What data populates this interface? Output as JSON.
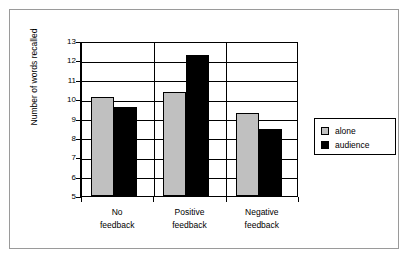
{
  "chart_data": {
    "type": "bar",
    "title": "",
    "xlabel": "",
    "ylabel": "Number of words recalled",
    "ylim": [
      5,
      13
    ],
    "yticks": [
      5,
      6,
      7,
      8,
      9,
      10,
      11,
      12,
      13
    ],
    "grid": true,
    "legend_position": "right",
    "categories": [
      "No feedback",
      "Positive feedback",
      "Negative feedback"
    ],
    "category_lines": [
      [
        "No",
        "feedback"
      ],
      [
        "Positive",
        "feedback"
      ],
      [
        "Negative",
        "feedback"
      ]
    ],
    "series": [
      {
        "name": "alone",
        "color": "#c0c0c0",
        "values": [
          10.1,
          10.35,
          9.3
        ]
      },
      {
        "name": "audience",
        "color": "#000000",
        "values": [
          9.6,
          12.3,
          8.45
        ]
      }
    ]
  },
  "legend": {
    "items": [
      {
        "label": "alone"
      },
      {
        "label": "audience"
      }
    ]
  },
  "axis": {
    "y_title": "Number of words recalled",
    "y_tick_labels": [
      "13",
      "12",
      "11",
      "10",
      "9",
      "8",
      "7",
      "6",
      "5"
    ]
  }
}
